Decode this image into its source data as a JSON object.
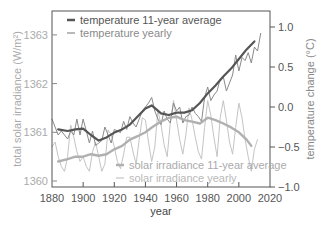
{
  "chart_data": {
    "type": "line",
    "title": "",
    "xlabel": "year",
    "ylabel_left": "total solar irradiance (W/m²)",
    "ylabel_right": "temperature change (°C)",
    "x_ticks": [
      1880,
      1900,
      1920,
      1940,
      1960,
      1980,
      2000,
      2020
    ],
    "y_left_ticks": [
      1360,
      1361,
      1362,
      1363
    ],
    "y_right_ticks": [
      -1.0,
      -0.5,
      0.0,
      0.5,
      1.0
    ],
    "y_right_tick_labels": [
      "−1.0",
      "−0.5",
      "0.0",
      "0.5",
      "1.0"
    ],
    "xlim": [
      1880,
      2020
    ],
    "ylim_left": [
      1359.87,
      1363.5
    ],
    "ylim_right": [
      -1.0,
      1.2
    ],
    "grid": false,
    "legend_position": "upper-left and lower-right",
    "series": [
      {
        "name": "temperature 11-year average",
        "axis": "right",
        "color": "#555555",
        "width": 2.2,
        "x": [
          1884,
          1890,
          1895,
          1900,
          1905,
          1910,
          1915,
          1920,
          1925,
          1930,
          1935,
          1940,
          1944,
          1950,
          1955,
          1960,
          1965,
          1970,
          1975,
          1980,
          1985,
          1990,
          1995,
          2000,
          2005,
          2010
        ],
        "values": [
          -0.28,
          -0.3,
          -0.28,
          -0.27,
          -0.35,
          -0.42,
          -0.38,
          -0.32,
          -0.28,
          -0.22,
          -0.12,
          -0.02,
          0.02,
          -0.08,
          -0.1,
          -0.07,
          -0.07,
          -0.04,
          0.05,
          0.17,
          0.27,
          0.38,
          0.48,
          0.6,
          0.72,
          0.82
        ]
      },
      {
        "name": "temperature yearly",
        "axis": "right",
        "color": "#8a8a8a",
        "width": 1,
        "x": [
          1880,
          1882,
          1884,
          1886,
          1888,
          1890,
          1892,
          1894,
          1896,
          1898,
          1900,
          1902,
          1904,
          1906,
          1908,
          1910,
          1912,
          1914,
          1916,
          1918,
          1920,
          1922,
          1924,
          1926,
          1928,
          1930,
          1932,
          1934,
          1936,
          1938,
          1940,
          1942,
          1944,
          1946,
          1948,
          1950,
          1952,
          1954,
          1956,
          1958,
          1960,
          1962,
          1964,
          1966,
          1968,
          1970,
          1972,
          1974,
          1976,
          1978,
          1980,
          1982,
          1984,
          1986,
          1988,
          1990,
          1992,
          1994,
          1996,
          1998,
          2000,
          2002,
          2004,
          2006,
          2008,
          2010,
          2012,
          2014
        ],
        "values": [
          -0.15,
          -0.25,
          -0.35,
          -0.3,
          -0.35,
          -0.4,
          -0.3,
          -0.35,
          -0.15,
          -0.35,
          -0.15,
          -0.3,
          -0.45,
          -0.3,
          -0.48,
          -0.45,
          -0.42,
          -0.25,
          -0.35,
          -0.45,
          -0.28,
          -0.3,
          -0.32,
          -0.18,
          -0.28,
          -0.12,
          -0.2,
          -0.25,
          -0.15,
          -0.05,
          0.0,
          0.05,
          0.12,
          -0.05,
          -0.15,
          -0.22,
          -0.05,
          -0.15,
          -0.2,
          0.05,
          -0.05,
          0.0,
          -0.2,
          -0.12,
          -0.1,
          0.0,
          -0.08,
          -0.12,
          -0.18,
          0.12,
          0.25,
          0.08,
          0.15,
          0.2,
          0.35,
          0.38,
          0.2,
          0.3,
          0.4,
          0.65,
          0.45,
          0.62,
          0.58,
          0.68,
          0.55,
          0.75,
          0.7,
          0.92
        ]
      },
      {
        "name": "solar irradiance 11-year average",
        "axis": "left",
        "color": "#b0b0b0",
        "width": 2.4,
        "x": [
          1884,
          1890,
          1895,
          1900,
          1905,
          1910,
          1915,
          1920,
          1925,
          1930,
          1935,
          1940,
          1945,
          1950,
          1955,
          1960,
          1965,
          1970,
          1975,
          1980,
          1985,
          1990,
          1995,
          2000,
          2005,
          2008
        ],
        "values": [
          1360.4,
          1360.45,
          1360.5,
          1360.5,
          1360.55,
          1360.52,
          1360.55,
          1360.65,
          1360.72,
          1360.85,
          1360.92,
          1361.0,
          1361.12,
          1361.22,
          1361.3,
          1361.32,
          1361.25,
          1361.22,
          1361.18,
          1361.3,
          1361.25,
          1361.18,
          1361.1,
          1361.0,
          1360.85,
          1360.72
        ]
      },
      {
        "name": "solar irradiance yearly",
        "axis": "left",
        "color": "#c4c4c4",
        "width": 1,
        "x": [
          1880,
          1882,
          1884,
          1886,
          1888,
          1890,
          1892,
          1894,
          1896,
          1898,
          1900,
          1902,
          1904,
          1906,
          1908,
          1910,
          1912,
          1914,
          1916,
          1918,
          1920,
          1922,
          1924,
          1926,
          1928,
          1930,
          1932,
          1934,
          1936,
          1938,
          1940,
          1942,
          1944,
          1946,
          1948,
          1950,
          1952,
          1954,
          1956,
          1958,
          1960,
          1962,
          1964,
          1966,
          1968,
          1970,
          1972,
          1974,
          1976,
          1978,
          1980,
          1982,
          1984,
          1986,
          1988,
          1990,
          1992,
          1994,
          1996,
          1998,
          2000,
          2002,
          2004,
          2006,
          2008,
          2010,
          2012
        ],
        "values": [
          1360.7,
          1360.8,
          1360.5,
          1360.3,
          1360.2,
          1360.5,
          1361.15,
          1360.9,
          1360.6,
          1360.4,
          1360.5,
          1360.3,
          1360.2,
          1360.6,
          1360.8,
          1360.5,
          1360.2,
          1360.35,
          1361.05,
          1360.95,
          1360.7,
          1360.4,
          1360.25,
          1360.55,
          1360.9,
          1360.9,
          1360.6,
          1360.35,
          1360.85,
          1361.3,
          1361.25,
          1360.8,
          1360.4,
          1360.7,
          1361.45,
          1361.15,
          1360.75,
          1360.5,
          1361.2,
          1361.65,
          1361.25,
          1360.85,
          1360.55,
          1360.95,
          1361.5,
          1361.25,
          1360.9,
          1360.6,
          1360.45,
          1361.1,
          1361.65,
          1361.35,
          1360.9,
          1360.5,
          1361.3,
          1361.65,
          1361.25,
          1360.8,
          1360.55,
          1361.1,
          1361.6,
          1361.3,
          1360.85,
          1360.5,
          1360.2,
          1360.65,
          1360.85
        ]
      }
    ]
  },
  "legend_top": {
    "items": [
      {
        "label": "temperature 11-year average",
        "color": "#555555",
        "thick": true
      },
      {
        "label": "temperature yearly",
        "color": "#8a8a8a",
        "thick": false
      }
    ]
  },
  "legend_bottom": {
    "items": [
      {
        "label": "solar irradiance 11-year average",
        "color": "#b0b0b0",
        "thick": true
      },
      {
        "label": "solar irradiance yearly",
        "color": "#c4c4c4",
        "thick": false
      }
    ]
  },
  "colors": {
    "frame": "#555555",
    "left_axis_text": "#aaaaaa",
    "right_axis_text": "#888888",
    "bottom_axis_text": "#444444"
  }
}
